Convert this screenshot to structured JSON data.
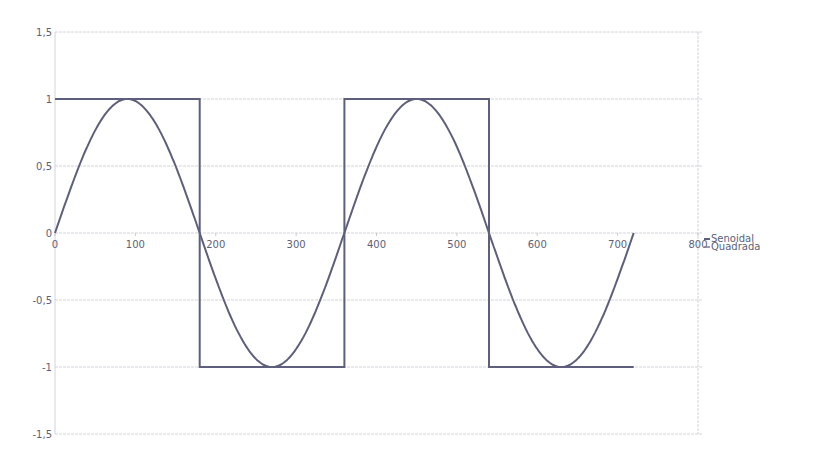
{
  "chart_data": {
    "type": "line",
    "title": "",
    "xlabel": "",
    "ylabel": "",
    "xlim": [
      0,
      800
    ],
    "ylim": [
      -1.5,
      1.5
    ],
    "xticks": [
      0,
      100,
      200,
      300,
      400,
      500,
      600,
      700,
      800
    ],
    "xtick_labels": [
      "0",
      "100",
      "200",
      "300",
      "400",
      "500",
      "600",
      "700",
      "800"
    ],
    "yticks": [
      1.5,
      1,
      0.5,
      0,
      -0.5,
      -1,
      -1.5
    ],
    "ytick_labels": [
      "1,5",
      "1",
      "0,5",
      "0",
      "-0,5",
      "-1",
      "-1,5"
    ],
    "grid": true,
    "legend_position": "right",
    "series": [
      {
        "name": "Senoidal",
        "function": "sin(x degrees)",
        "x": [
          0,
          30,
          60,
          90,
          120,
          150,
          180,
          210,
          240,
          270,
          300,
          330,
          360,
          390,
          420,
          450,
          480,
          510,
          540,
          570,
          600,
          630,
          660,
          690,
          720
        ],
        "values": [
          0,
          0.5,
          0.866,
          1,
          0.866,
          0.5,
          0,
          -0.5,
          -0.866,
          -1,
          -0.866,
          -0.5,
          0,
          0.5,
          0.866,
          1,
          0.866,
          0.5,
          0,
          -0.5,
          -0.866,
          -1,
          -0.866,
          -0.5,
          0
        ],
        "color": "#5d5f7c"
      },
      {
        "name": "Quadrada",
        "x": [
          0,
          180,
          180,
          360,
          360,
          540,
          540,
          720
        ],
        "values": [
          1,
          1,
          -1,
          -1,
          1,
          1,
          -1,
          -1
        ],
        "color": "#7c7e98"
      }
    ]
  },
  "legend": {
    "items": [
      "Senoidal",
      "Quadrada"
    ]
  }
}
